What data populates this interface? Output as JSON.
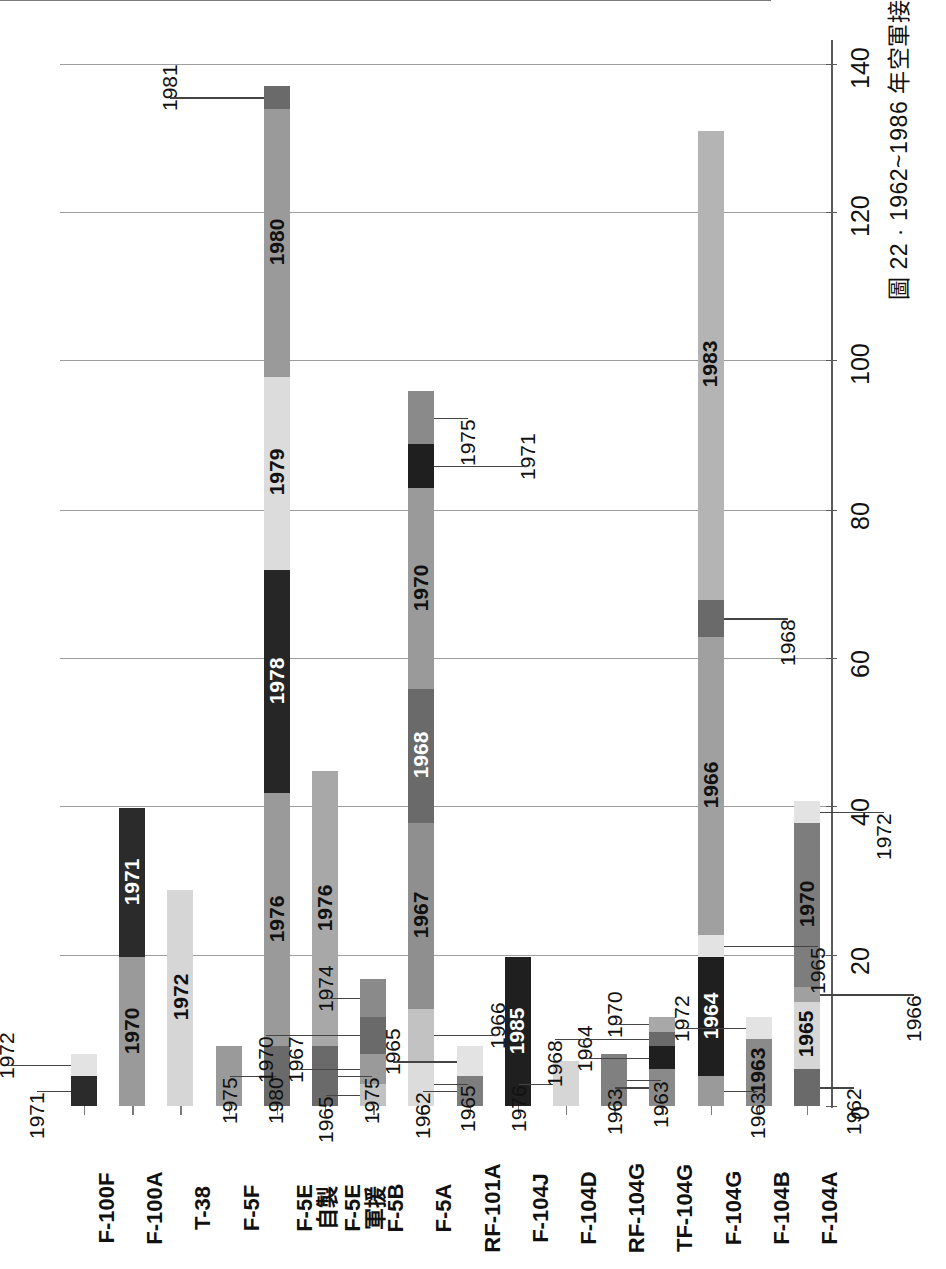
{
  "caption": "圖 22 · 1962~1986 年空軍接收軍援 / 自製 / 採購戰機數量（按年度統計）",
  "chart_data": {
    "type": "bar",
    "title": "圖 22 · 1962~1986 年空軍接收軍援 / 自製 / 採購戰機數量（按年度統計）",
    "orientation": "horizontal",
    "stacked": true,
    "xlabel": "",
    "ylabel": "",
    "ylim": [
      0,
      145
    ],
    "grid": true,
    "legend": "none",
    "value_ticks": [
      0,
      20,
      40,
      60,
      80,
      100,
      120,
      140
    ],
    "categories": [
      "F-100F",
      "F-100A",
      "T-38",
      "F-5F",
      "F-5E\n自製",
      "F-5E\n軍援",
      "F-5B",
      "F-5A",
      "RF-101A",
      "F-104J",
      "F-104D",
      "RF-104G",
      "TF-104G",
      "F-104G",
      "F-104B",
      "F-104A"
    ],
    "series": [
      {
        "category": "F-100F",
        "total": 7,
        "segments": [
          {
            "year": "1971",
            "value": 4,
            "shade": "#2b2b2b"
          },
          {
            "year": "1972",
            "value": 3,
            "shade": "#e3e3e3"
          }
        ]
      },
      {
        "category": "F-100A",
        "total": 40,
        "segments": [
          {
            "year": "1970",
            "value": 20,
            "shade": "#9a9a9a"
          },
          {
            "year": "1971",
            "value": 20,
            "shade": "#2b2b2b"
          }
        ]
      },
      {
        "category": "T-38",
        "total": 29,
        "segments": [
          {
            "year": "1972",
            "value": 29,
            "shade": "#d6d6d6"
          }
        ]
      },
      {
        "category": "F-5F",
        "total": 8,
        "segments": [
          {
            "year": "1980",
            "value": 8,
            "shade": "#9a9a9a"
          }
        ]
      },
      {
        "category": "F-5E\n自製",
        "total": 137,
        "segments": [
          {
            "year": "1975",
            "value": 8,
            "shade": "#6a6a6a"
          },
          {
            "year": "1976",
            "value": 34,
            "shade": "#9a9a9a"
          },
          {
            "year": "1978",
            "value": 30,
            "shade": "#262626"
          },
          {
            "year": "1979",
            "value": 26,
            "shade": "#dcdcdc"
          },
          {
            "year": "1980",
            "value": 36,
            "shade": "#9a9a9a"
          },
          {
            "year": "1981",
            "value": 3,
            "shade": "#6a6a6a"
          }
        ]
      },
      {
        "category": "F-5E\n軍援",
        "total": 45,
        "segments": [
          {
            "year": "1975",
            "value": 8,
            "shade": "#6a6a6a"
          },
          {
            "year": "1976",
            "value": 37,
            "shade": "#a8a8a8"
          }
        ]
      },
      {
        "category": "F-5B",
        "total": 17,
        "segments": [
          {
            "year": "1965",
            "value": 3,
            "shade": "#c2c2c2"
          },
          {
            "year": "1967",
            "value": 4,
            "shade": "#9a9a9a"
          },
          {
            "year": "1970",
            "value": 5,
            "shade": "#6a6a6a"
          },
          {
            "year": "1974",
            "value": 5,
            "shade": "#8a8a8a"
          }
        ]
      },
      {
        "category": "F-5A",
        "total": 96,
        "segments": [
          {
            "year": "1965",
            "value": 6,
            "shade": "#dcdcdc"
          },
          {
            "year": "1966",
            "value": 7,
            "shade": "#c2c2c2"
          },
          {
            "year": "1967",
            "value": 25,
            "shade": "#8f8f8f"
          },
          {
            "year": "1968",
            "value": 18,
            "shade": "#6a6a6a"
          },
          {
            "year": "1970",
            "value": 27,
            "shade": "#9a9a9a"
          },
          {
            "year": "1971",
            "value": 6,
            "shade": "#1f1f1f"
          },
          {
            "year": "1975",
            "value": 7,
            "shade": "#8a8a8a"
          }
        ]
      },
      {
        "category": "RF-101A",
        "total": 8,
        "segments": [
          {
            "year": "1962",
            "value": 4,
            "shade": "#7d7d7d"
          },
          {
            "year": "1965",
            "value": 4,
            "shade": "#e3e3e3"
          }
        ]
      },
      {
        "category": "F-104J",
        "total": 20,
        "segments": [
          {
            "year": "1985",
            "value": 20,
            "shade": "#1f1f1f"
          }
        ]
      },
      {
        "category": "F-104D",
        "total": 6,
        "segments": [
          {
            "year": "1976",
            "value": 6,
            "shade": "#d6d6d6"
          }
        ]
      },
      {
        "category": "RF-104G",
        "total": 7,
        "segments": [
          {
            "year": "1963",
            "value": 7,
            "shade": "#808080"
          }
        ]
      },
      {
        "category": "TF-104G",
        "total": 12,
        "segments": [
          {
            "year": "1963",
            "value": 5,
            "shade": "#8a8a8a"
          },
          {
            "year": "1964",
            "value": 3,
            "shade": "#1f1f1f"
          },
          {
            "year": "1968",
            "value": 2,
            "shade": "#6a6a6a"
          },
          {
            "year": "1970",
            "value": 2,
            "shade": "#a8a8a8"
          }
        ]
      },
      {
        "category": "F-104G",
        "total": 131,
        "segments": [
          {
            "year": "1963",
            "value": 4,
            "shade": "#9a9a9a"
          },
          {
            "year": "1964",
            "value": 16,
            "shade": "#1f1f1f"
          },
          {
            "year": "1965",
            "value": 3,
            "shade": "#e3e3e3"
          },
          {
            "year": "1966",
            "value": 40,
            "shade": "#a0a0a0"
          },
          {
            "year": "1968",
            "value": 5,
            "shade": "#6a6a6a"
          },
          {
            "year": "1983",
            "value": 63,
            "shade": "#b4b4b4"
          }
        ]
      },
      {
        "category": "F-104B",
        "total": 12,
        "segments": [
          {
            "year": "1963",
            "value": 9,
            "shade": "#8a8a8a"
          },
          {
            "year": "1972",
            "value": 3,
            "shade": "#e3e3e3"
          }
        ]
      },
      {
        "category": "F-104A",
        "total": 41,
        "segments": [
          {
            "year": "1962",
            "value": 5,
            "shade": "#6a6a6a"
          },
          {
            "year": "1965",
            "value": 9,
            "shade": "#d6d6d6"
          },
          {
            "year": "1966",
            "value": 2,
            "shade": "#a0a0a0"
          },
          {
            "year": "1970",
            "value": 22,
            "shade": "#7d7d7d"
          },
          {
            "year": "1972",
            "value": 3,
            "shade": "#e3e3e3"
          }
        ]
      }
    ]
  }
}
